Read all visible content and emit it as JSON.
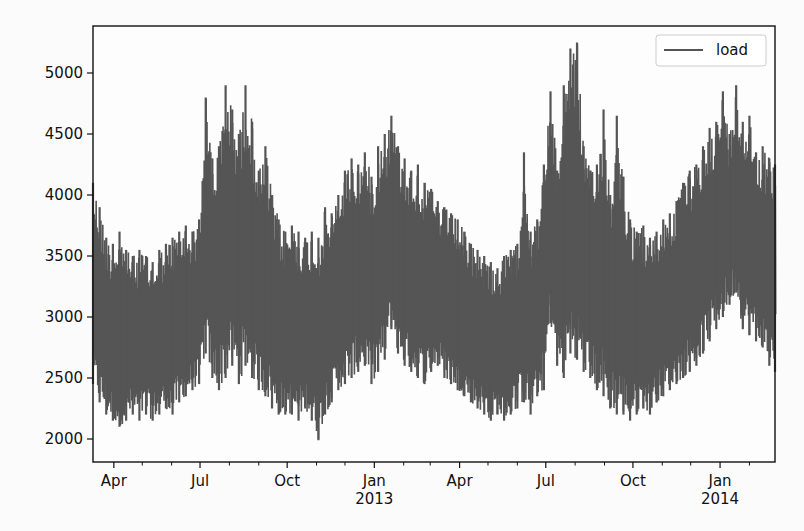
{
  "chart_data": {
    "type": "line",
    "title": "",
    "xlabel": "",
    "ylabel": "",
    "grid": false,
    "legend": {
      "position": "top-right",
      "entries": [
        {
          "label": "load",
          "color": "#555555"
        }
      ]
    },
    "series_color": "#555555",
    "x_range": [
      "2012-03-10",
      "2014-02-28"
    ],
    "ylim": [
      1830,
      5400
    ],
    "y_ticks": [
      2000,
      2500,
      3000,
      3500,
      4000,
      4500,
      5000
    ],
    "y_tick_labels": [
      "2000",
      "2500",
      "3000",
      "3500",
      "4000",
      "4500",
      "5000"
    ],
    "x_ticks": [
      {
        "date": "2012-04-01",
        "label": "Apr",
        "sub": ""
      },
      {
        "date": "2012-07-01",
        "label": "Jul",
        "sub": ""
      },
      {
        "date": "2012-10-01",
        "label": "Oct",
        "sub": ""
      },
      {
        "date": "2013-01-01",
        "label": "Jan",
        "sub": "2013"
      },
      {
        "date": "2013-04-01",
        "label": "Apr",
        "sub": ""
      },
      {
        "date": "2013-07-01",
        "label": "Jul",
        "sub": ""
      },
      {
        "date": "2013-10-01",
        "label": "Oct",
        "sub": ""
      },
      {
        "date": "2014-01-01",
        "label": "Jan",
        "sub": "2014"
      }
    ],
    "x_minor_ticks": [
      "2012-05-01",
      "2012-06-01",
      "2012-08-01",
      "2012-09-01",
      "2012-11-01",
      "2012-12-01",
      "2013-02-01",
      "2013-03-01",
      "2013-05-01",
      "2013-06-01",
      "2013-08-01",
      "2013-09-01",
      "2013-11-01",
      "2013-12-01",
      "2014-02-01"
    ],
    "envelope": {
      "description": "Approximate daily max / min load envelope sampled every ~7 days (data units)",
      "dates": [
        "2012-03-10",
        "2012-03-17",
        "2012-03-24",
        "2012-03-31",
        "2012-04-07",
        "2012-04-14",
        "2012-04-21",
        "2012-04-28",
        "2012-05-05",
        "2012-05-12",
        "2012-05-19",
        "2012-05-26",
        "2012-06-02",
        "2012-06-09",
        "2012-06-16",
        "2012-06-23",
        "2012-06-30",
        "2012-07-07",
        "2012-07-14",
        "2012-07-21",
        "2012-07-28",
        "2012-08-04",
        "2012-08-11",
        "2012-08-18",
        "2012-08-25",
        "2012-09-01",
        "2012-09-08",
        "2012-09-15",
        "2012-09-22",
        "2012-09-29",
        "2012-10-06",
        "2012-10-13",
        "2012-10-20",
        "2012-10-27",
        "2012-11-03",
        "2012-11-10",
        "2012-11-17",
        "2012-11-24",
        "2012-12-01",
        "2012-12-08",
        "2012-12-15",
        "2012-12-22",
        "2012-12-29",
        "2013-01-05",
        "2013-01-12",
        "2013-01-19",
        "2013-01-26",
        "2013-02-02",
        "2013-02-09",
        "2013-02-16",
        "2013-02-23",
        "2013-03-02",
        "2013-03-09",
        "2013-03-16",
        "2013-03-23",
        "2013-03-30",
        "2013-04-06",
        "2013-04-13",
        "2013-04-20",
        "2013-04-27",
        "2013-05-04",
        "2013-05-11",
        "2013-05-18",
        "2013-05-25",
        "2013-06-01",
        "2013-06-08",
        "2013-06-15",
        "2013-06-22",
        "2013-06-29",
        "2013-07-06",
        "2013-07-13",
        "2013-07-20",
        "2013-07-27",
        "2013-08-03",
        "2013-08-10",
        "2013-08-17",
        "2013-08-24",
        "2013-08-31",
        "2013-09-07",
        "2013-09-14",
        "2013-09-21",
        "2013-09-28",
        "2013-10-05",
        "2013-10-12",
        "2013-10-19",
        "2013-10-26",
        "2013-11-02",
        "2013-11-09",
        "2013-11-16",
        "2013-11-23",
        "2013-11-30",
        "2013-12-07",
        "2013-12-14",
        "2013-12-21",
        "2013-12-28",
        "2014-01-04",
        "2014-01-11",
        "2014-01-18",
        "2014-01-25",
        "2014-02-01",
        "2014-02-08",
        "2014-02-15",
        "2014-02-22",
        "2014-02-28"
      ],
      "max": [
        4100,
        3900,
        3650,
        3600,
        3700,
        3550,
        3500,
        3550,
        3500,
        3450,
        3550,
        3600,
        3650,
        3700,
        3750,
        3700,
        3800,
        4800,
        4300,
        4400,
        4900,
        4700,
        4500,
        4900,
        4600,
        4200,
        4400,
        4000,
        3800,
        3700,
        3750,
        3700,
        3650,
        3700,
        3650,
        3900,
        3850,
        4000,
        4200,
        4300,
        4250,
        4350,
        4150,
        4400,
        4500,
        4650,
        4400,
        4300,
        4200,
        4250,
        4100,
        4050,
        3950,
        3900,
        3850,
        3800,
        3700,
        3600,
        3550,
        3500,
        3450,
        3400,
        3500,
        3550,
        3600,
        4350,
        3700,
        3800,
        4250,
        4850,
        4200,
        4900,
        5200,
        5250,
        4400,
        4200,
        4250,
        4700,
        4000,
        4650,
        4150,
        3800,
        3700,
        3750,
        3650,
        3700,
        3800,
        3850,
        3950,
        4100,
        4200,
        4250,
        4400,
        4550,
        4600,
        4850,
        4500,
        4900,
        4600,
        4650,
        4350,
        4400,
        4300,
        4250
      ],
      "min": [
        2450,
        2300,
        2200,
        2150,
        2100,
        2150,
        2200,
        2150,
        2200,
        2150,
        2200,
        2250,
        2200,
        2300,
        2350,
        2400,
        2450,
        2700,
        2500,
        2400,
        2500,
        2600,
        2450,
        2600,
        2500,
        2400,
        2350,
        2250,
        2200,
        2200,
        2200,
        2150,
        2250,
        2150,
        1990,
        2200,
        2300,
        2400,
        2450,
        2500,
        2550,
        2600,
        2450,
        2550,
        2650,
        2900,
        2700,
        2600,
        2550,
        2500,
        2450,
        2550,
        2600,
        2500,
        2450,
        2400,
        2350,
        2300,
        2250,
        2200,
        2150,
        2200,
        2150,
        2200,
        2250,
        2300,
        2200,
        2350,
        2400,
        2950,
        2600,
        2500,
        2700,
        2650,
        2550,
        2500,
        2400,
        2350,
        2250,
        2200,
        2200,
        2150,
        2200,
        2250,
        2200,
        2300,
        2350,
        2400,
        2450,
        2500,
        2550,
        2600,
        2700,
        2800,
        2900,
        3000,
        3100,
        3200,
        2900,
        2850,
        2800,
        2750,
        2600,
        2550
      ]
    }
  }
}
